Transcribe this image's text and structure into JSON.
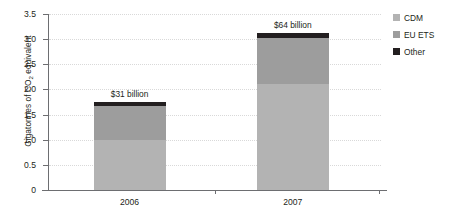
{
  "chart_data": {
    "type": "bar",
    "subtype": "stacked-bar",
    "title": "",
    "xlabel": "",
    "ylabel": "Gigatonnes of CO2 equivalent",
    "ylabel_prefix": "Gigatonnes of CO",
    "ylabel_subscript": "2",
    "ylabel_suffix": " equivalent",
    "categories": [
      "2006",
      "2007"
    ],
    "ylim": [
      0,
      3.5
    ],
    "ytick_labels": [
      "0",
      "0.5",
      "1.0",
      "1.5",
      "2.0",
      "2.5",
      "3.0",
      "3.5"
    ],
    "ytick_values": [
      0,
      0.5,
      1.0,
      1.5,
      2.0,
      2.5,
      3.0,
      3.5
    ],
    "grid": true,
    "grid_style": "dotted-horizontal",
    "legend_position": "top-right",
    "series": [
      {
        "name": "CDM",
        "values": [
          1.0,
          2.1
        ],
        "color": "#b3b3b3"
      },
      {
        "name": "EU ETS",
        "values": [
          0.68,
          0.93
        ],
        "color": "#9d9d9d"
      },
      {
        "name": "Other",
        "values": [
          0.07,
          0.09
        ],
        "color": "#231f20"
      }
    ],
    "totals": [
      1.75,
      3.12
    ],
    "annotations": [
      {
        "category": "2006",
        "text": "$31 billion"
      },
      {
        "category": "2007",
        "text": "$64 billion"
      }
    ]
  },
  "colors": {
    "cdm": "#b3b3b3",
    "eu_ets": "#9d9d9d",
    "other": "#231f20",
    "axis": "#6d6e71",
    "grid": "#d9d9d9",
    "text": "#231f20",
    "background": "#ffffff"
  },
  "legend": {
    "items": [
      {
        "label": "CDM"
      },
      {
        "label": "EU ETS"
      },
      {
        "label": "Other"
      }
    ]
  }
}
